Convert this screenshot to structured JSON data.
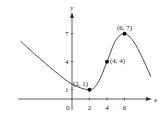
{
  "chart_data": {
    "type": "line",
    "title": "",
    "xlabel": "x",
    "ylabel": "y",
    "origin_label": "0",
    "x_ticks": [
      2,
      4,
      6
    ],
    "x_tick_labels": [
      "2",
      "4",
      "6"
    ],
    "y_ticks": [
      1,
      4,
      7
    ],
    "y_tick_labels": [
      "1",
      "4",
      "7"
    ],
    "xlim": [
      -6,
      9
    ],
    "ylim": [
      0,
      8
    ],
    "grid": false,
    "legend": "none",
    "series": [
      {
        "name": "f(x)",
        "description": "smooth curve decreasing to local minimum at (2,1), inflection near (4,4), local maximum at (6,7), then decreasing",
        "x": [
          -5.9,
          -4,
          -2,
          0,
          2,
          3,
          4,
          5,
          6,
          7,
          8,
          9
        ],
        "y": [
          6.2,
          4.6,
          3.0,
          1.6,
          1.0,
          1.8,
          4.0,
          6.3,
          7.0,
          6.2,
          4.5,
          2.4
        ]
      }
    ],
    "marked_points": [
      {
        "x": 2,
        "y": 1,
        "label": "(2, 1)"
      },
      {
        "x": 4,
        "y": 4,
        "label": "(4, 4)"
      },
      {
        "x": 6,
        "y": 7,
        "label": "(6, 7)"
      }
    ]
  }
}
